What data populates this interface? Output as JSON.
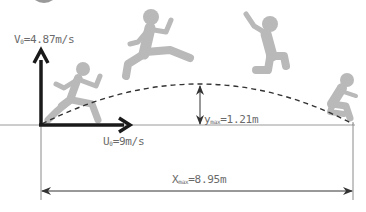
{
  "diagram": {
    "type": "projectile-motion-long-jump",
    "labels": {
      "v0": {
        "symbol": "V",
        "sub": "0",
        "value": "=4.87m/s"
      },
      "u0": {
        "symbol": "U",
        "sub": "0",
        "value": "=9m/s"
      },
      "ymax": {
        "symbol": "y",
        "sub": "max",
        "value": "=1.21m"
      },
      "xmax": {
        "symbol": "X",
        "sub": "max",
        "value": "=8.95m"
      }
    },
    "figures": [
      "runner-takeoff",
      "jumper-rising",
      "jumper-peak-descending",
      "jumper-landing"
    ],
    "colors": {
      "figure": "#b8b8b8",
      "axis_arrow": "#1a1a1a",
      "thin_line": "#8a8a8a",
      "trajectory": "#333333",
      "text": "#6a6a6a"
    }
  }
}
